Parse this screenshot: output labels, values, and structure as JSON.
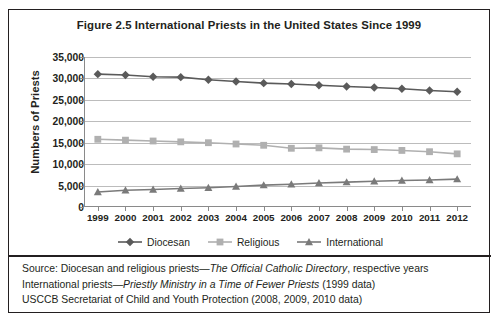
{
  "figure": {
    "title": "Figure 2.5 International Priests in the United States Since 1999"
  },
  "chart_data": {
    "type": "line",
    "title": "Figure 2.5 International Priests in the United States Since 1999",
    "xlabel": "",
    "ylabel": "Numbers of Priests",
    "ylim": [
      0,
      35000
    ],
    "yticks": [
      "0",
      "5,000",
      "10,000",
      "15,000",
      "20,000",
      "25,000",
      "30,000",
      "35,000"
    ],
    "ytick_values": [
      0,
      5000,
      10000,
      15000,
      20000,
      25000,
      30000,
      35000
    ],
    "grid": true,
    "legend_position": "bottom",
    "categories": [
      "1999",
      "2000",
      "2001",
      "2002",
      "2003",
      "2004",
      "2005",
      "2006",
      "2007",
      "2008",
      "2009",
      "2010",
      "2011",
      "2012"
    ],
    "series": [
      {
        "name": "Diocesan",
        "marker": "diamond",
        "color": "#5a5a5a",
        "values": [
          31000,
          30800,
          30400,
          30300,
          29700,
          29300,
          28900,
          28700,
          28400,
          28100,
          27900,
          27600,
          27200,
          26900
        ]
      },
      {
        "name": "Religious",
        "marker": "square",
        "color": "#b0b0b0",
        "values": [
          15800,
          15600,
          15400,
          15200,
          15000,
          14700,
          14400,
          13700,
          13800,
          13500,
          13400,
          13200,
          12900,
          12400
        ]
      },
      {
        "name": "International",
        "marker": "triangle",
        "color": "#7a7a7a",
        "values": [
          3500,
          3900,
          4100,
          4300,
          4500,
          4800,
          5100,
          5300,
          5600,
          5800,
          6000,
          6200,
          6300,
          6500
        ]
      }
    ]
  },
  "legend": [
    {
      "label": "Diocesan"
    },
    {
      "label": "Religious"
    },
    {
      "label": "International"
    }
  ],
  "footer": {
    "line1_pre": "Source: Diocesan and religious priests—",
    "line1_italic": "The Official Catholic Directory",
    "line1_post": ", respective years",
    "line2_pre": "International priests—",
    "line2_italic": "Priestly Ministry in a Time of Fewer Priests",
    "line2_post": " (1999 data)",
    "line3": "USCCB Secretariat of Child and Youth Protection (2008, 2009, 2010 data)"
  }
}
